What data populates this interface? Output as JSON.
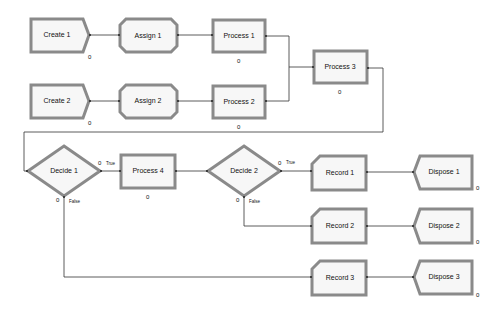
{
  "modules": {
    "create1": {
      "label": "Create 1",
      "count": "0"
    },
    "create2": {
      "label": "Create 2",
      "count": "0"
    },
    "assign1": {
      "label": "Assign 1"
    },
    "assign2": {
      "label": "Assign 2"
    },
    "process1": {
      "label": "Process 1",
      "count": "0"
    },
    "process2": {
      "label": "Process 2",
      "count": "0"
    },
    "process3": {
      "label": "Process 3",
      "count": "0"
    },
    "process4": {
      "label": "Process 4",
      "count": "0"
    },
    "decide1": {
      "label": "Decide 1",
      "true_count": "0",
      "false_count": "0",
      "true_label": "True",
      "false_label": "False"
    },
    "decide2": {
      "label": "Decide 2",
      "true_count": "0",
      "false_count": "0",
      "true_label": "True",
      "false_label": "False"
    },
    "record1": {
      "label": "Record 1"
    },
    "record2": {
      "label": "Record 2"
    },
    "record3": {
      "label": "Record 3"
    },
    "dispose1": {
      "label": "Dispose 1",
      "count": "0"
    },
    "dispose2": {
      "label": "Dispose 2",
      "count": "0"
    },
    "dispose3": {
      "label": "Dispose 3",
      "count": "0"
    }
  }
}
